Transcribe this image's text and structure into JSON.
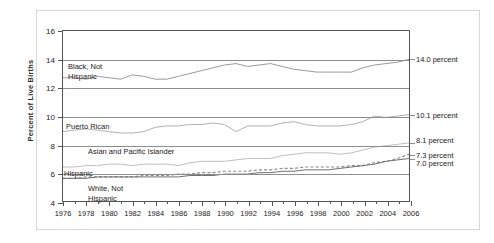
{
  "chart_data": {
    "type": "line",
    "title": "",
    "xlabel": "",
    "ylabel": "Percent of Live Births",
    "xlim": [
      1976,
      2006
    ],
    "ylim": [
      4,
      16
    ],
    "ytick_step": 2,
    "grid": true,
    "legend_position": "inline-plot-labels",
    "x": [
      1976,
      1977,
      1978,
      1979,
      1980,
      1981,
      1982,
      1983,
      1984,
      1985,
      1986,
      1987,
      1988,
      1989,
      1990,
      1991,
      1992,
      1993,
      1994,
      1995,
      1996,
      1997,
      1998,
      1999,
      2000,
      2001,
      2002,
      2003,
      2004,
      2005,
      2006
    ],
    "ytick_labels": [
      "4",
      "6",
      "8",
      "10",
      "12",
      "14",
      "16"
    ],
    "xtick_labels": [
      "1976",
      "1978",
      "1980",
      "1982",
      "1984",
      "1986",
      "1988",
      "1990",
      "1992",
      "1994",
      "1996",
      "1998",
      "2000",
      "2002",
      "2004",
      "2006"
    ],
    "series": [
      {
        "name": "Black, Not Hispanic",
        "style": "solid",
        "color": "#9a9a9a",
        "end_value": 14.0,
        "end_label": "14.0 percent",
        "values": [
          12.7,
          12.7,
          12.6,
          12.8,
          12.7,
          12.6,
          12.9,
          12.8,
          12.6,
          12.6,
          12.8,
          13.0,
          13.2,
          13.4,
          13.6,
          13.7,
          13.5,
          13.6,
          13.7,
          13.5,
          13.3,
          13.2,
          13.1,
          13.1,
          13.1,
          13.1,
          13.4,
          13.6,
          13.7,
          13.8,
          14.0
        ]
      },
      {
        "name": "Puerto Rican",
        "style": "solid",
        "color": "#b0b0b0",
        "end_value": 10.1,
        "end_label": "10.1 percent",
        "values": [
          8.9,
          9.0,
          9.1,
          9.0,
          8.9,
          8.8,
          8.8,
          8.9,
          9.2,
          9.3,
          9.3,
          9.4,
          9.4,
          9.5,
          9.4,
          8.9,
          9.3,
          9.3,
          9.3,
          9.5,
          9.6,
          9.4,
          9.3,
          9.3,
          9.3,
          9.4,
          9.6,
          10.0,
          9.9,
          10.0,
          10.1
        ]
      },
      {
        "name": "Asian and Pacific Islander",
        "style": "solid",
        "color": "#bdbdbd",
        "end_value": 8.1,
        "end_label": "8.1 percent",
        "values": [
          6.4,
          6.4,
          6.5,
          6.5,
          6.6,
          6.6,
          6.5,
          6.6,
          6.6,
          6.6,
          6.5,
          6.7,
          6.8,
          6.8,
          6.8,
          6.9,
          7.0,
          7.0,
          7.0,
          7.2,
          7.3,
          7.4,
          7.4,
          7.4,
          7.3,
          7.4,
          7.6,
          7.8,
          7.9,
          8.0,
          8.1
        ]
      },
      {
        "name": "Hispanic",
        "style": "dashed",
        "color": "#8a8a8a",
        "end_value": 7.3,
        "end_label": "7.3 percent",
        "values": [
          5.6,
          5.6,
          5.7,
          5.7,
          5.7,
          5.7,
          5.7,
          5.8,
          5.8,
          5.8,
          5.9,
          5.9,
          6.0,
          6.0,
          6.1,
          6.1,
          6.1,
          6.2,
          6.2,
          6.3,
          6.3,
          6.4,
          6.4,
          6.4,
          6.4,
          6.5,
          6.5,
          6.7,
          6.8,
          7.0,
          7.3
        ]
      },
      {
        "name": "White, Not Hispanic",
        "style": "solid",
        "color": "#6e6e6e",
        "end_value": 7.0,
        "end_label": "7.0 percent",
        "values": [
          5.6,
          5.6,
          5.6,
          5.7,
          5.7,
          5.7,
          5.7,
          5.7,
          5.7,
          5.7,
          5.7,
          5.8,
          5.8,
          5.8,
          5.9,
          5.9,
          5.9,
          6.0,
          6.0,
          6.1,
          6.1,
          6.2,
          6.2,
          6.2,
          6.3,
          6.4,
          6.5,
          6.6,
          6.8,
          6.9,
          7.0
        ]
      }
    ],
    "inline_labels": [
      {
        "text": "Black, Not\nHispanic",
        "series": "Black, Not Hispanic"
      },
      {
        "text": "Puerto Rican",
        "series": "Puerto Rican"
      },
      {
        "text": "Asian and Pacific Islander",
        "series": "Asian and Pacific Islander"
      },
      {
        "text": "Hispanic",
        "series": "Hispanic"
      },
      {
        "text": "White, Not\nHispanic",
        "series": "White, Not Hispanic"
      }
    ]
  }
}
